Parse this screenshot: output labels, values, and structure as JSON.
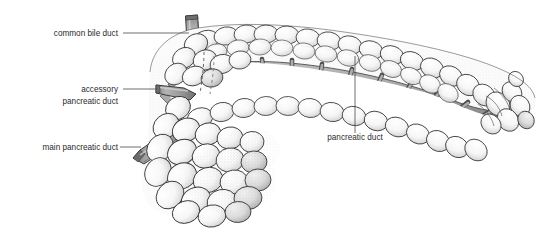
{
  "figure": {
    "background_color": "#ffffff",
    "width": 546,
    "height": 230
  },
  "labels": [
    {
      "id": "common-bile-duct",
      "text": "common bile duct",
      "lines": [
        "common bile duct"
      ],
      "text_x": 118,
      "text_y": 36,
      "anchor": "end",
      "leader": "M 123,33 L 189,33",
      "target": "superior vertical tube entering pancreatic head"
    },
    {
      "id": "accessory-pancreatic-duct",
      "text": "accessory pancreatic duct",
      "lines": [
        "accessory",
        "pancreatic duct"
      ],
      "line1": "accessory",
      "line2": "pancreatic duct",
      "text_x": 118,
      "text_y": 92,
      "line2_y": 104,
      "anchor": "end",
      "leader": "M 123,89 L 157,89",
      "target": "upper horizontal duct stump on left of head"
    },
    {
      "id": "main-pancreatic-duct",
      "text": "main pancreatic duct",
      "lines": [
        "main pancreatic duct"
      ],
      "text_x": 118,
      "text_y": 150,
      "anchor": "end",
      "leader": "M 120,147 L 141,147",
      "target": "lower angled duct stump on left of head"
    },
    {
      "id": "pancreatic-duct",
      "text": "pancreatic duct",
      "lines": [
        "pancreatic duct"
      ],
      "text_x": 355,
      "text_y": 140,
      "anchor": "middle",
      "leader": "M 355,133 L 355,56",
      "target": "central duct within pancreatic body"
    }
  ],
  "colors": {
    "text": "#2b2b2b",
    "leader_line": "#4a4a4a",
    "outline": "#2f2f2f",
    "duct_fill": "#9a9a9a",
    "duct_fill_light": "#b0b0b0",
    "duct_shadow": "#6e6e6e",
    "lobule_fill": "#fdfdfd",
    "lobule_shade": "#d6d6d6",
    "matrix_fill": "#a8a8a8",
    "matrix_dark": "#7d7d7d",
    "stipple": "#8c8c8c"
  },
  "anatomy": {
    "regions": [
      {
        "name": "head",
        "note": "bulbous left portion with inferior uncinate lobules"
      },
      {
        "name": "neck",
        "note": "narrowing between head and body"
      },
      {
        "name": "body",
        "note": "elongated arching mid portion"
      },
      {
        "name": "tail",
        "note": "tapered right terminus curving inferiorly"
      }
    ],
    "duct_stumps": [
      {
        "name": "common bile duct",
        "orientation": "vertical, descending into head"
      },
      {
        "name": "accessory pancreatic duct",
        "orientation": "horizontal, projecting left"
      },
      {
        "name": "main pancreatic duct",
        "orientation": "oblique, projecting inferolaterally left"
      }
    ],
    "duct_pattern": "central longitudinal duct with alternating superior and inferior branching tributaries in a herringbone arrangement"
  }
}
